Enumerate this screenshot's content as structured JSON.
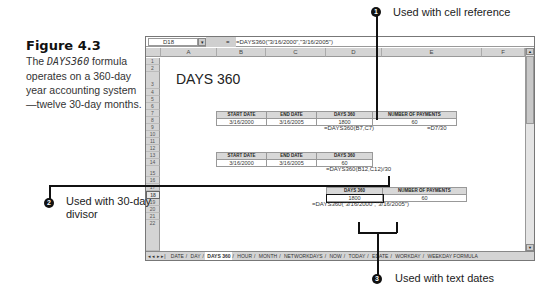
{
  "caption": {
    "figure": "Figure 4.3",
    "desc_pre": "The ",
    "desc_func": "DAYS360",
    "desc_post": " formula operates on a 360-day year accounting system—twelve 30-day months."
  },
  "spreadsheet": {
    "name_box": "D18",
    "formula_bar": "=DAYS360(\"3/16/2000\",\"3/16/2005\")",
    "columns": [
      "A",
      "B",
      "C",
      "D",
      "E",
      "F"
    ],
    "rows": [
      "1",
      "2",
      "3",
      "4",
      "5",
      "6",
      "7",
      "8",
      "9",
      "10",
      "11",
      "12",
      "13",
      "14",
      "15",
      "16",
      "17",
      "18",
      "19",
      "20",
      "21",
      "22"
    ],
    "sheet_title": "DAYS 360",
    "table1": {
      "headers": [
        "START DATE",
        "END DATE",
        "DAYS 360",
        "NUMBER OF PAYMENTS"
      ],
      "values": [
        "3/16/2000",
        "3/16/2005",
        "1800",
        "60"
      ],
      "formulas": [
        "=DAYS360(B7,C7)",
        "=D7/30"
      ]
    },
    "table2": {
      "headers": [
        "START DATE",
        "END DATE",
        "DAYS 360"
      ],
      "values": [
        "3/16/2000",
        "3/16/2005",
        "60"
      ],
      "formula": "=DAYS360(B12,C12)/30"
    },
    "table3": {
      "headers": [
        "DAYS 360",
        "NUMBER OF PAYMENTS"
      ],
      "values": [
        "1800",
        "60"
      ],
      "formula": "=DAYS360(\"3/16/2000\",\"3/16/2005\")"
    },
    "tab_nav": "◂ ◂ ▸ ▸|",
    "tabs": [
      "DATE",
      "DAY",
      "DAYS 360",
      "HOUR",
      "MONTH",
      "NETWORKDAYS",
      "NOW",
      "TODAY",
      "EDATE",
      "WORKDAY",
      "WEEKDAY FORMULA"
    ],
    "active_tab": "DAYS 360"
  },
  "callouts": [
    {
      "num": "1",
      "text": "Used with cell reference"
    },
    {
      "num": "2",
      "text": "Used with 30-day divisor"
    },
    {
      "num": "3",
      "text": "Used with text dates"
    }
  ]
}
